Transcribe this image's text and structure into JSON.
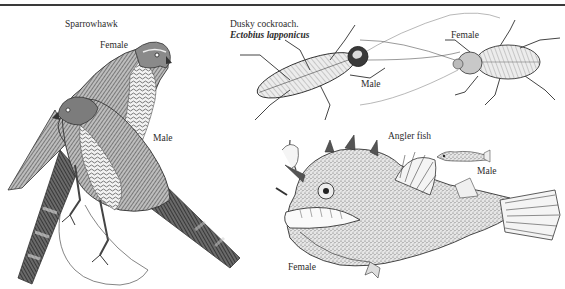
{
  "plate": {
    "sections": [
      {
        "title": "Sparrowhawk",
        "labels": [
          "Female",
          "Male"
        ]
      },
      {
        "title": "Dusky cockroach.",
        "subtitle": "Ectobius lapponicus",
        "labels": [
          "Male",
          "Female"
        ]
      },
      {
        "title": "Angler fish",
        "labels": [
          "Male",
          "Female"
        ]
      }
    ]
  },
  "colors": {
    "ink": "#2b2b2b",
    "paper": "#ffffff",
    "stipple": "#8a8a8a"
  }
}
